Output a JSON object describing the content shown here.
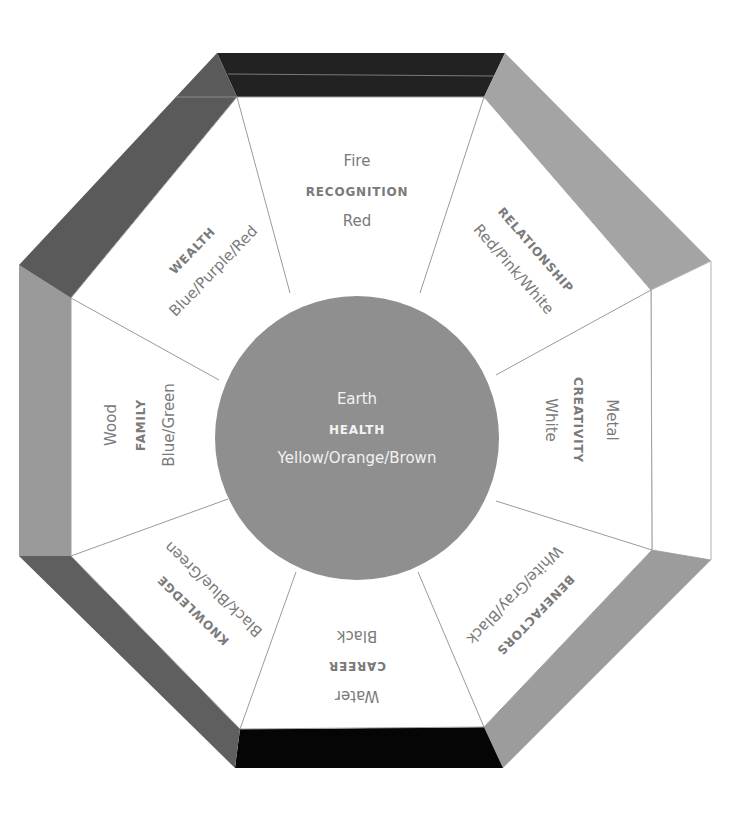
{
  "diagram": {
    "colors": {
      "band_top": "#222222",
      "band_top_right": "#a4a4a4",
      "band_right": "#ffffff",
      "band_bottom_right": "#9c9c9c",
      "band_bottom": "#050505",
      "band_bottom_left": "#5f5f5f",
      "band_left": "#9a9a9a",
      "band_top_left": "#5a5a5a",
      "center_fill": "#8f8f8f",
      "label_text": "#7a7a7a",
      "center_text": "#f2f2f2"
    },
    "center": {
      "element": "Earth",
      "area": "HEALTH",
      "colors": "Yellow/Orange/Brown"
    },
    "sectors": [
      {
        "id": "top",
        "element": "Fire",
        "area": "RECOGNITION",
        "colors": "Red"
      },
      {
        "id": "top-right",
        "element": "",
        "area": "RELATIONSHIP",
        "colors": "Red/Pink/White"
      },
      {
        "id": "right",
        "element": "Metal",
        "area": "CREATIVITY",
        "colors": "White"
      },
      {
        "id": "bottom-right",
        "element": "",
        "area": "BENEFACTORS",
        "colors": "White/Gray/Black"
      },
      {
        "id": "bottom",
        "element": "Water",
        "area": "CAREER",
        "colors": "Black"
      },
      {
        "id": "bottom-left",
        "element": "",
        "area": "KNOWLEDGE",
        "colors": "Black/Blue/Green"
      },
      {
        "id": "left",
        "element": "Wood",
        "area": "FAMILY",
        "colors": "Blue/Green"
      },
      {
        "id": "top-left",
        "element": "",
        "area": "WEALTH",
        "colors": "Blue/Purple/Red"
      }
    ]
  }
}
